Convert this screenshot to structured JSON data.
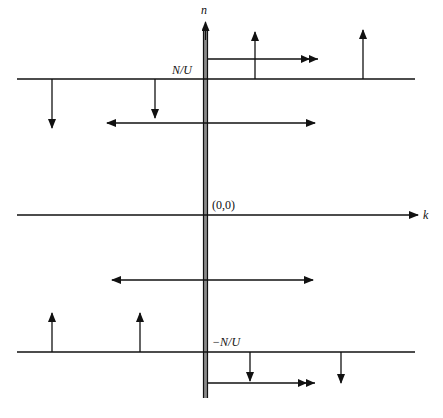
{
  "diagram": {
    "axes": {
      "vertical_label": "n",
      "horizontal_label": "k",
      "origin_label": "(0,0)"
    },
    "lines": {
      "top_label": "N/U",
      "bottom_label": "−N/U"
    },
    "colors": {
      "ink": "#111111",
      "axis_bar_fill": "#8a8a8a",
      "background": "#ffffff"
    },
    "elements": {
      "top_up_arrows_x": [
        255,
        363
      ],
      "top_down_arrows_x": [
        52,
        155
      ],
      "bottom_up_arrows_x": [
        52,
        140
      ],
      "bottom_down_arrows_x": [
        250,
        341
      ],
      "upper_double_arrow": {
        "x1": 107,
        "x2": 315,
        "y": 123
      },
      "lower_double_arrow": {
        "x1": 112,
        "x2": 313,
        "y": 280
      },
      "top_right_arrow": {
        "x1": 208,
        "x2": 318,
        "y": 59
      },
      "bottom_right_arrow": {
        "x1": 208,
        "x2": 315,
        "y": 383
      }
    }
  }
}
